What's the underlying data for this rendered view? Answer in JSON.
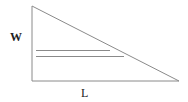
{
  "diagram": {
    "labels": {
      "width": "W",
      "length": "L"
    },
    "colors": {
      "stroke": "#8a8a8a",
      "text": "#222222",
      "background": "#ffffff"
    },
    "shapes": {
      "triangle": {
        "points": "32,6 32,81 179,81"
      },
      "line_upper": {
        "x1": 36,
        "y1": 50.5,
        "x2": 110,
        "y2": 50.5
      },
      "line_lower": {
        "x1": 36,
        "y1": 56.5,
        "x2": 124,
        "y2": 56.5
      }
    }
  }
}
